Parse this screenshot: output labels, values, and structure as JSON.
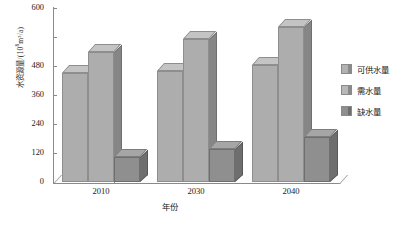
{
  "chart_data": {
    "type": "bar",
    "title": "",
    "xlabel": "年份",
    "ylabel": "水资源量/(10⁸m³/a)",
    "ylabel_main": "水资源量/(10",
    "ylabel_sup": "8",
    "ylabel_tail": "m³/a)",
    "categories": [
      "2010",
      "2030",
      "2040"
    ],
    "series": [
      {
        "name": "可供水量",
        "values": [
          375,
          383,
          405
        ]
      },
      {
        "name": "需水量",
        "values": [
          450,
          492,
          535
        ]
      },
      {
        "name": "缺水量",
        "values": [
          85,
          115,
          155
        ]
      }
    ],
    "ylim": [
      0,
      600
    ],
    "yticks": [
      "0",
      "120",
      "240",
      "360",
      "480",
      "600"
    ],
    "grid": false,
    "legend_position": "right",
    "style": "3d-columns-grayscale",
    "colors": {
      "supply_face": "#adadad",
      "demand_face": "#b8b8b8",
      "shortage_face": "#8f8f8f",
      "axis": "#8a8a8a",
      "text": "#1a1a1a"
    }
  },
  "legend": {
    "items": [
      {
        "label": "可供水量"
      },
      {
        "label": "需水量"
      },
      {
        "label": "缺水量"
      }
    ]
  }
}
